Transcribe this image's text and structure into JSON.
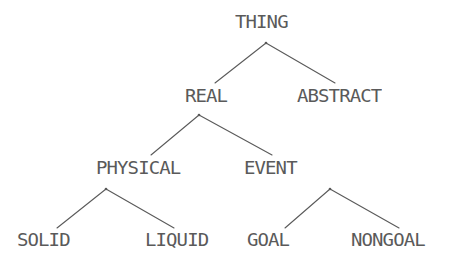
{
  "diagram": {
    "type": "taxonomy-tree",
    "title": "",
    "background_color": "#ffffff",
    "line_color": "#5a5a5a",
    "text_color": "#5a5a5a",
    "nodes": [
      {
        "id": "thing",
        "label": "THING",
        "level": 0
      },
      {
        "id": "real",
        "label": "REAL",
        "level": 1
      },
      {
        "id": "abstract",
        "label": "ABSTRACT",
        "level": 1
      },
      {
        "id": "physical",
        "label": "PHYSICAL",
        "level": 2
      },
      {
        "id": "event",
        "label": "EVENT",
        "level": 2
      },
      {
        "id": "solid",
        "label": "SOLID",
        "level": 3
      },
      {
        "id": "liquid",
        "label": "LIQUID",
        "level": 3
      },
      {
        "id": "goal",
        "label": "GOAL",
        "level": 3
      },
      {
        "id": "nongoal",
        "label": "NONGOAL",
        "level": 3
      }
    ],
    "edges": [
      {
        "from": "thing",
        "to": "real"
      },
      {
        "from": "thing",
        "to": "abstract"
      },
      {
        "from": "real",
        "to": "physical"
      },
      {
        "from": "real",
        "to": "event"
      },
      {
        "from": "physical",
        "to": "solid"
      },
      {
        "from": "physical",
        "to": "liquid"
      },
      {
        "from": "event",
        "to": "goal"
      },
      {
        "from": "event",
        "to": "nongoal"
      }
    ]
  }
}
